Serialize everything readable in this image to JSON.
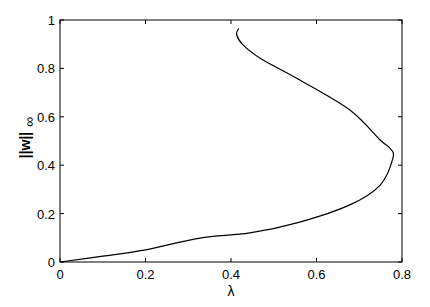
{
  "chart_data": {
    "type": "line",
    "title": "",
    "xlabel": "λ",
    "ylabel": "||w||∞",
    "ylabel_main": "||w||",
    "ylabel_sub": "∞",
    "xlim": [
      0,
      0.8
    ],
    "ylim": [
      0,
      1
    ],
    "grid": false,
    "legend": null,
    "xticks": [
      "0",
      "0.2",
      "0.4",
      "0.6",
      "0.8"
    ],
    "yticks": [
      "0",
      "0.2",
      "0.4",
      "0.6",
      "0.8",
      "1"
    ],
    "series": [
      {
        "name": "bifurcation curve",
        "x": [
          0,
          0.1,
          0.2,
          0.327,
          0.444,
          0.561,
          0.678,
          0.749,
          0.779,
          0.772,
          0.749,
          0.678,
          0.561,
          0.47,
          0.428,
          0.413,
          0.418
        ],
        "y": [
          0,
          0.024,
          0.05,
          0.099,
          0.12,
          0.165,
          0.236,
          0.318,
          0.43,
          0.47,
          0.504,
          0.628,
          0.752,
          0.84,
          0.897,
          0.94,
          0.965
        ]
      }
    ]
  }
}
